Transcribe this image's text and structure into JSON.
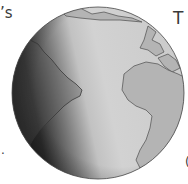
{
  "figure": {
    "colors": {
      "land": "#b4b4b4",
      "ocean_light": "#cfcfcf",
      "shadow": "#2a2a2a",
      "outline": "#5a5a5a"
    }
  },
  "text_fragments": {
    "top_left": "’s",
    "top_right": "T",
    "bottom_left": ".",
    "bottom_right": "("
  }
}
